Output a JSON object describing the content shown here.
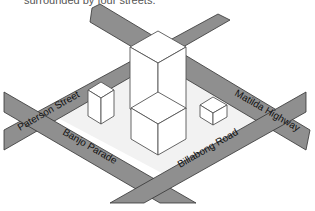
{
  "caption": "surrounded by four streets.",
  "streets": {
    "paterson": "Paterson Street",
    "banjo": "Banjo Parade",
    "billabong": "Billabong Road",
    "matilda": "Matilda Highway"
  },
  "colors": {
    "road": "#8f8f8f",
    "block": "#f2f2f2",
    "building": "#ffffff",
    "outline": "#555555"
  }
}
